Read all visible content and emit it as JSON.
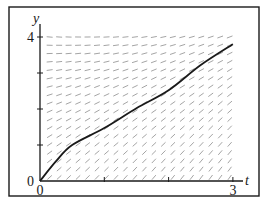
{
  "figure": {
    "frame": {
      "x": 9,
      "y": 7,
      "width": 250,
      "height": 189,
      "stroke": "#1a1a1a"
    },
    "axes": {
      "origin_px": [
        40,
        181
      ],
      "t_px_per_unit": 64.3,
      "y_px_per_unit": 36,
      "t_axis_end_px": 243,
      "y_axis_top_px": 24,
      "x_label": "t",
      "y_label": "y",
      "x_ticks": [
        {
          "value": 0,
          "label": "0"
        },
        {
          "value": 1,
          "label": ""
        },
        {
          "value": 2,
          "label": ""
        },
        {
          "value": 3,
          "label": "3"
        }
      ],
      "y_ticks": [
        {
          "value": 0,
          "label": "0"
        },
        {
          "value": 1,
          "label": ""
        },
        {
          "value": 2,
          "label": ""
        },
        {
          "value": 3,
          "label": ""
        },
        {
          "value": 4,
          "label": "4"
        }
      ],
      "axis_color": "#1a1a1a"
    },
    "slope_field": {
      "t_range": [
        0.15,
        2.95
      ],
      "y_range": [
        0.1,
        4.0
      ],
      "cols": 20,
      "rows": 18,
      "segment_length_px": 6,
      "color": "#9a9a9a",
      "model": {
        "a": 1.6,
        "b": -0.45,
        "c": 0.3
      }
    },
    "solution_curve": {
      "color": "#1a1a1a",
      "points": [
        [
          0,
          0
        ],
        [
          0.25,
          0.55
        ],
        [
          0.5,
          1.0
        ],
        [
          1.0,
          1.47
        ],
        [
          1.5,
          2.02
        ],
        [
          2.0,
          2.52
        ],
        [
          2.5,
          3.22
        ],
        [
          3.0,
          3.8
        ]
      ]
    }
  },
  "chart_data": {
    "type": "line",
    "title": "",
    "xlabel": "t",
    "ylabel": "y",
    "xlim": [
      0,
      3
    ],
    "ylim": [
      0,
      4
    ],
    "x_tick_labels": [
      "0",
      "3"
    ],
    "y_tick_labels": [
      "0",
      "4"
    ],
    "grid": false,
    "annotations": [
      "slope field (direction field) with one solution curve through (0, 0)"
    ],
    "series": [
      {
        "name": "solution curve",
        "x": [
          0,
          0.25,
          0.5,
          1.0,
          1.5,
          2.0,
          2.5,
          3.0
        ],
        "values": [
          0,
          0.55,
          1.0,
          1.47,
          2.02,
          2.52,
          3.22,
          3.8
        ]
      }
    ]
  }
}
